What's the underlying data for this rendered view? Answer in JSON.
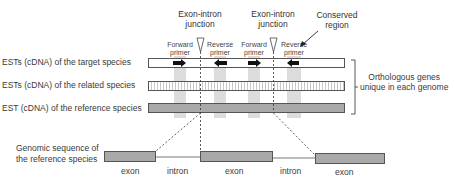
{
  "diagram": {
    "junctions": [
      {
        "label_line1": "Exon-intron",
        "label_line2": "junction"
      },
      {
        "label_line1": "Exon-intron",
        "label_line2": "junction"
      }
    ],
    "conserved_region": {
      "line1": "Conserved",
      "line2": "region"
    },
    "primers": [
      {
        "line1": "Forward",
        "line2": "primer",
        "direction": "right"
      },
      {
        "line1": "Reverse",
        "line2": "primer",
        "direction": "left"
      },
      {
        "line1": "Forward",
        "line2": "primer",
        "direction": "right"
      },
      {
        "line1": "Reverse",
        "line2": "primer",
        "direction": "left"
      }
    ],
    "rows": [
      {
        "label": "ESTs (cDNA) of the target species",
        "style": "white"
      },
      {
        "label": "ESTs (cDNA) of the related species",
        "style": "hatched"
      },
      {
        "label": "EST (cDNA) of the reference species",
        "style": "gray"
      }
    ],
    "bracket_label": {
      "line1": "Orthologous genes",
      "line2": "unique in each genome"
    },
    "genomic": {
      "label_line1": "Genomic sequence of",
      "label_line2": "the reference species",
      "segments": [
        "exon",
        "intron",
        "exon",
        "intron",
        "exon"
      ]
    },
    "colors": {
      "column": "#dcdcdc",
      "bar_gray": "#a9a9a9",
      "outline": "#555555",
      "arrow": "#111111"
    }
  }
}
